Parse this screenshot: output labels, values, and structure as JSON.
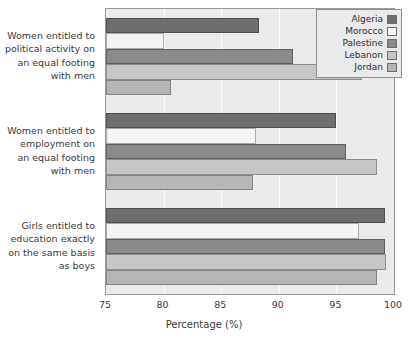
{
  "chart_data": {
    "type": "bar",
    "orientation": "horizontal",
    "title": "",
    "xlabel": "Percentage (%)",
    "ylabel": "",
    "xlim": [
      75,
      100
    ],
    "xticks": [
      75,
      80,
      85,
      90,
      95,
      100
    ],
    "xtick_labels": [
      "75",
      "80",
      "85",
      "90",
      "95",
      "100"
    ],
    "grid": true,
    "legend_position": "top-right",
    "categories": [
      "Women entitled to political activity on an equal footing with men",
      "Women entitled to employment on an equal footing with men",
      "Girls entitled to education exactly on the same basis as boys"
    ],
    "category_lines": [
      [
        "Women entitled to",
        "political activity on",
        "an equal footing",
        "with men"
      ],
      [
        "Women entitled to",
        "employment on",
        "an equal footing",
        "with men"
      ],
      [
        "Girls entitled to",
        "education exactly",
        "on the same basis",
        "as boys"
      ]
    ],
    "series": [
      {
        "name": "Algeria",
        "color": "#6e6e6e",
        "values": [
          88.3,
          95.0,
          99.2
        ]
      },
      {
        "name": "Morocco",
        "color": "#f4f4f4",
        "values": [
          80.0,
          88.0,
          97.0
        ]
      },
      {
        "name": "Palestine",
        "color": "#8a8a8a",
        "values": [
          91.2,
          95.8,
          99.2
        ]
      },
      {
        "name": "Lebanon",
        "color": "#c6c6c6",
        "values": [
          97.2,
          98.5,
          99.3
        ]
      },
      {
        "name": "Jordan",
        "color": "#b5b5b5",
        "values": [
          80.6,
          87.8,
          98.5
        ]
      }
    ]
  },
  "legend": {
    "items": [
      {
        "label": "Algeria"
      },
      {
        "label": "Morocco"
      },
      {
        "label": "Palestine"
      },
      {
        "label": "Lebanon"
      },
      {
        "label": "Jordan"
      }
    ]
  },
  "axis": {
    "x_title": "Percentage (%)"
  }
}
